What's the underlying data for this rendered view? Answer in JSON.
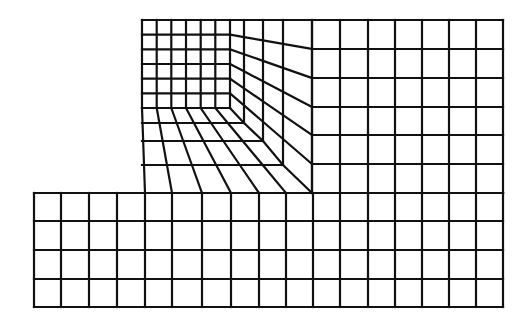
{
  "figure": {
    "type": "finite-element-mesh",
    "line_color": "#111111",
    "background": "#ffffff"
  },
  "upper_block": {
    "fine_grid": {
      "cols_x": [
        142,
        156.7,
        171.3,
        186,
        200.7,
        215.3,
        230
      ],
      "rows_y": [
        20,
        34.7,
        49.3,
        64,
        78.7,
        93.3,
        108
      ]
    },
    "ring_corners": [
      {
        "x": 244,
        "y": 123
      },
      {
        "x": 263,
        "y": 141
      },
      {
        "x": 283,
        "y": 165
      },
      {
        "x": 312,
        "y": 193
      }
    ],
    "right_edge_rows_y": [
      20,
      49,
      78,
      107,
      135,
      164,
      193
    ],
    "bottom_edge_cols_x": [
      145,
      172,
      202,
      231,
      259,
      286,
      313
    ],
    "coarse_right": {
      "cols_x": [
        312,
        340,
        368,
        395,
        422,
        449,
        476,
        503
      ],
      "rows_y": [
        20,
        49,
        78,
        107,
        135,
        164,
        193
      ]
    }
  },
  "lower_block": {
    "cols_x": [
      34,
      61,
      89,
      117,
      145,
      172,
      202,
      231,
      259,
      286,
      313,
      340,
      368,
      395,
      422,
      449,
      476,
      503
    ],
    "rows_y": [
      193,
      221,
      250,
      279,
      307
    ]
  },
  "counts": {
    "fine_cells": "6 x 6",
    "transition_rings": 4,
    "right_coarse_cells": "7 x 6",
    "lower_cells": "17 x 4"
  }
}
